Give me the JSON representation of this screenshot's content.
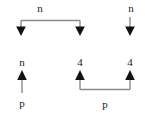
{
  "diagram": {
    "type": "arrow-bracket-diagram",
    "width": 145,
    "height": 120,
    "background_color": "#ffffff",
    "line_color": "#808080",
    "arrowhead_color": "#111111",
    "text_color": "#1a1a1a",
    "groups": [
      {
        "id": "top-bracket",
        "description": "horizontal bracket with two downward arrows",
        "label": "n",
        "label_position": "above-center",
        "arrow_direction": "down",
        "arrow_count": 2
      },
      {
        "id": "top-right-arrow",
        "description": "standalone downward arrow",
        "label": "n",
        "label_position": "above",
        "arrow_direction": "down",
        "arrow_count": 1
      },
      {
        "id": "bottom-left-arrow",
        "description": "standalone upward arrow with labels above and below",
        "label_top": "n",
        "label_bottom": "p",
        "arrow_direction": "up",
        "arrow_count": 1
      },
      {
        "id": "bottom-bracket",
        "description": "horizontal bracket with two upward arrows",
        "label": "p",
        "label_position": "below-center",
        "arrow_direction": "up",
        "arrow_count": 2,
        "arrow_labels": [
          "4",
          "4"
        ]
      }
    ]
  },
  "labels": {
    "n_top_bracket": "n",
    "n_top_right": "n",
    "n_bottom_left": "n",
    "p_bottom_left": "p",
    "four_left": "4",
    "four_right": "4",
    "p_bottom_bracket": "p"
  }
}
